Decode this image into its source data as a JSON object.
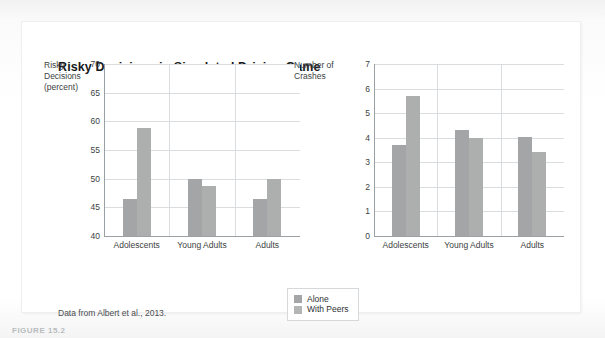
{
  "figure": {
    "title": "Risky Decisions in Simulated Driving Game",
    "source_note": "Data from Albert et al., 2013.",
    "caption": "FIGURE 15.2"
  },
  "legend": {
    "position": "bottom-center",
    "items": [
      {
        "label": "Alone",
        "color": "#a3a5a6",
        "icon": "legend-swatch"
      },
      {
        "label": "With Peers",
        "color": "#b3b5b5",
        "icon": "legend-swatch"
      }
    ]
  },
  "colors": {
    "alone": "#a3a5a6",
    "with_peers": "#adafaf",
    "grid": "#d9dde0",
    "axis": "#9aa0a4",
    "text": "#3c3f42",
    "card": "#ffffff"
  },
  "chart_data": [
    {
      "id": "risky-decisions",
      "type": "bar",
      "title": "",
      "xlabel": "",
      "ylabel": "Risky Decisions (percent)",
      "ylabel_lines": [
        "Risky",
        "Decisions",
        "(percent)"
      ],
      "categories": [
        "Adolescents",
        "Young Adults",
        "Adults"
      ],
      "series": [
        {
          "name": "Alone",
          "values": [
            46.4,
            50.0,
            46.4
          ]
        },
        {
          "name": "With Peers",
          "values": [
            58.8,
            48.7,
            50.0
          ]
        }
      ],
      "ylim": [
        40,
        70
      ],
      "yticks": [
        70,
        65,
        60,
        55,
        50,
        45,
        40
      ],
      "ytick_labels": [
        "70",
        "65",
        "60",
        "55",
        "50",
        "45",
        "40"
      ],
      "grid": true,
      "legend": "shared-bottom"
    },
    {
      "id": "number-of-crashes",
      "type": "bar",
      "title": "",
      "xlabel": "",
      "ylabel": "Number of Crashes",
      "ylabel_lines": [
        "Number of",
        "Crashes"
      ],
      "categories": [
        "Adolescents",
        "Young Adults",
        "Adults"
      ],
      "series": [
        {
          "name": "Alone",
          "values": [
            3.7,
            4.3,
            4.05
          ]
        },
        {
          "name": "With Peers",
          "values": [
            5.7,
            4.0,
            3.4
          ]
        }
      ],
      "ylim": [
        0,
        7
      ],
      "yticks": [
        7,
        6,
        5,
        4,
        3,
        2,
        1,
        0
      ],
      "ytick_labels": [
        "7",
        "6",
        "5",
        "4",
        "3",
        "2",
        "1",
        "0"
      ],
      "grid": true,
      "legend": "shared-bottom"
    }
  ]
}
